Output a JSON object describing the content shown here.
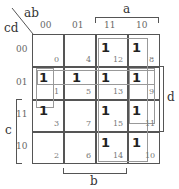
{
  "kmap": {
    "row_var": "cd",
    "col_var": "ab",
    "col_headers": [
      "00",
      "01",
      "11",
      "10"
    ],
    "row_headers": [
      "00",
      "01",
      "11",
      "10"
    ],
    "cells": [
      [
        {
          "value": "",
          "index": "0"
        },
        {
          "value": "",
          "index": "4"
        },
        {
          "value": "1",
          "index": "12"
        },
        {
          "value": "1",
          "index": "8"
        }
      ],
      [
        {
          "value": "1",
          "index": "1"
        },
        {
          "value": "1",
          "index": "5"
        },
        {
          "value": "1",
          "index": "13"
        },
        {
          "value": "1",
          "index": "9"
        }
      ],
      [
        {
          "value": "1",
          "index": "3"
        },
        {
          "value": "",
          "index": "7"
        },
        {
          "value": "1",
          "index": "15"
        },
        {
          "value": "1",
          "index": "11"
        }
      ],
      [
        {
          "value": "",
          "index": "2"
        },
        {
          "value": "",
          "index": "6"
        },
        {
          "value": "1",
          "index": "14"
        },
        {
          "value": "1",
          "index": "10"
        }
      ]
    ],
    "brackets": {
      "a": "a",
      "b": "b",
      "c": "c",
      "d": "d"
    }
  }
}
